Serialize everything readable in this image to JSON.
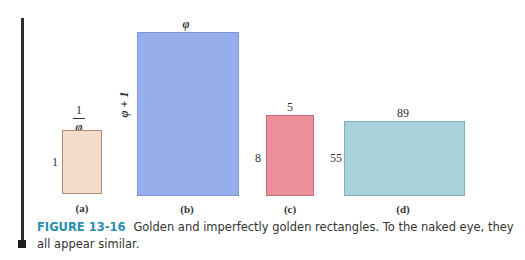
{
  "figure": {
    "number_label": "FIGURE 13-16",
    "caption": "Golden and imperfectly golden rectangles. To the naked eye, they all appear similar.",
    "accent_color": "#2a8fb0"
  },
  "rectangles": [
    {
      "id": "a",
      "sublabel": "(a)",
      "width_label_numerator": "1",
      "width_label_denominator": "φ",
      "height_label": "1",
      "fill": "#f5dccb",
      "border": "#b08a78"
    },
    {
      "id": "b",
      "sublabel": "(b)",
      "width_label": "φ",
      "height_label": "φ + 1",
      "fill": "#97aeec",
      "border": "#7f96d8"
    },
    {
      "id": "c",
      "sublabel": "(c)",
      "width_label": "5",
      "height_label": "8",
      "fill": "#eb8f9b",
      "border": "#c76c79"
    },
    {
      "id": "d",
      "sublabel": "(d)",
      "width_label": "89",
      "height_label": "55",
      "fill": "#a9d1d9",
      "border": "#7fb0bb"
    }
  ]
}
